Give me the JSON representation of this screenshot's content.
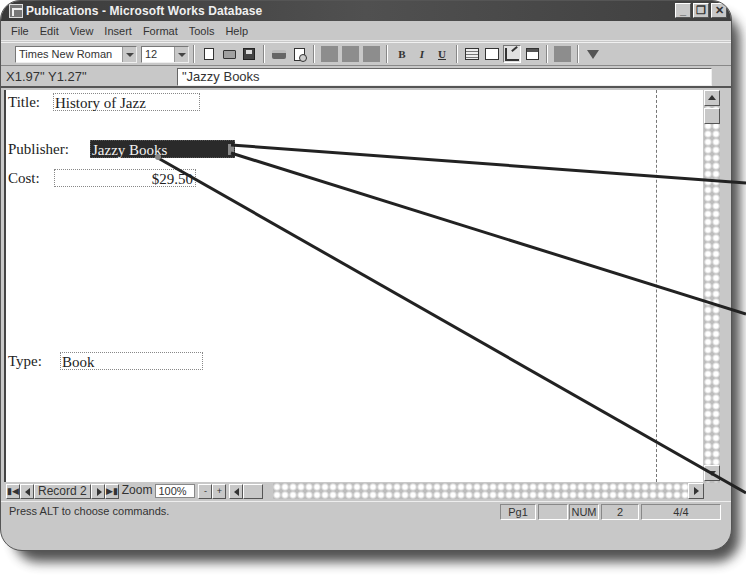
{
  "window": {
    "title": "Publications - Microsoft Works Database",
    "controls": {
      "minimize": "_",
      "restore": "❐",
      "close": "✕"
    }
  },
  "menubar": {
    "items": [
      {
        "label": "File",
        "accel": "F"
      },
      {
        "label": "Edit",
        "accel": "E"
      },
      {
        "label": "View",
        "accel": "V"
      },
      {
        "label": "Insert",
        "accel": "I"
      },
      {
        "label": "Format",
        "accel": "o"
      },
      {
        "label": "Tools",
        "accel": "T"
      },
      {
        "label": "Help",
        "accel": "H"
      }
    ]
  },
  "toolbar": {
    "font_name": "Times New Roman",
    "font_size": "12",
    "icons": [
      "new-icon",
      "open-icon",
      "save-icon",
      "print-icon",
      "print-preview-icon",
      "disabled-1",
      "disabled-2",
      "disabled-3",
      "bold-icon",
      "italic-icon",
      "underline-icon",
      "list-view-icon",
      "form-view-icon",
      "form-design-icon",
      "report-view-icon",
      "disabled-4",
      "filter-icon"
    ],
    "bold": "B",
    "italic": "I",
    "underline": "U"
  },
  "entrybar": {
    "coordinates": "X1.97\" Y1.27\"",
    "entry_value": "\"Jazzy Books"
  },
  "form": {
    "fields": [
      {
        "label": "Title:",
        "value": "History of Jazz"
      },
      {
        "label": "Publisher:",
        "value": "Jazzy Books",
        "selected": true
      },
      {
        "label": "Cost:",
        "value": "$29.50"
      },
      {
        "label": "Type:",
        "value": "Book"
      }
    ]
  },
  "navigation": {
    "record_label": "Record 2",
    "zoom_label": "Zoom",
    "zoom_value": "100%",
    "zoom_minus": "-",
    "zoom_plus": "+"
  },
  "statusbar": {
    "message": "Press ALT to choose commands.",
    "page": "Pg1",
    "blank": "",
    "num": "NUM",
    "record_number": "2",
    "record_count": "4/4"
  },
  "colors": {
    "title_bar": "#3a3a3a",
    "chrome": "#c8c8c8",
    "selection": "#2a2a2a"
  }
}
